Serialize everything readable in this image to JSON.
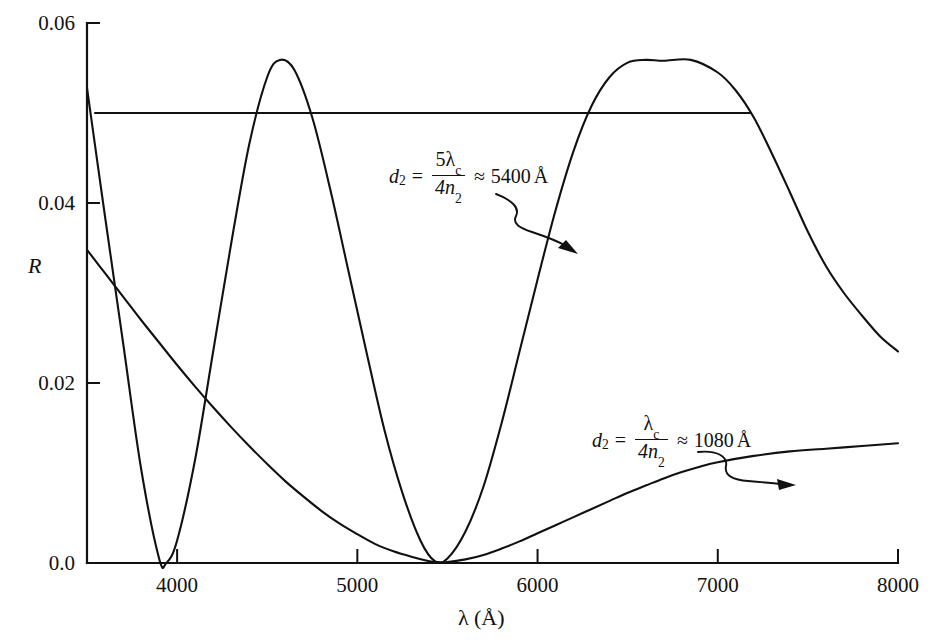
{
  "chart_data": {
    "type": "line",
    "title": "",
    "xlabel": "λ (Å)",
    "ylabel": "R",
    "xlim": [
      3500,
      8000
    ],
    "ylim": [
      0.0,
      0.06
    ],
    "grid": false,
    "legend_position": "none",
    "x_ticks": [
      4000,
      5000,
      6000,
      7000,
      8000
    ],
    "x_tick_labels": [
      "4000",
      "5000",
      "6000",
      "7000",
      "8000"
    ],
    "y_ticks": [
      0.0,
      0.02,
      0.04,
      0.06
    ],
    "y_tick_labels": [
      "0.0",
      "0.02",
      "0.04",
      "0.06"
    ],
    "series": [
      {
        "name": "d2 = 5*lambda_c/(4*n2) ~ 5400 A",
        "x": [
          3500,
          3600,
          3700,
          3800,
          3900,
          3940,
          4000,
          4100,
          4200,
          4300,
          4400,
          4500,
          4570,
          4650,
          4750,
          4850,
          4950,
          5050,
          5150,
          5250,
          5350,
          5430,
          5500,
          5600,
          5700,
          5800,
          5900,
          6000,
          6100,
          6200,
          6300,
          6400,
          6500,
          6600,
          6700,
          6850,
          7000,
          7100,
          7200,
          7300,
          7400,
          7500,
          7600,
          7700,
          7800,
          7900,
          8000
        ],
        "y": [
          0.0528,
          0.0385,
          0.0245,
          0.0105,
          0.0005,
          0.0,
          0.0025,
          0.0115,
          0.0235,
          0.0355,
          0.0465,
          0.054,
          0.0559,
          0.0548,
          0.0495,
          0.0415,
          0.0325,
          0.0235,
          0.0148,
          0.0078,
          0.0025,
          0.0002,
          0.0005,
          0.0035,
          0.0085,
          0.0155,
          0.0235,
          0.0315,
          0.0392,
          0.0458,
          0.0508,
          0.054,
          0.0556,
          0.0559,
          0.0558,
          0.0559,
          0.0545,
          0.0525,
          0.0495,
          0.0455,
          0.0412,
          0.0368,
          0.033,
          0.03,
          0.0275,
          0.0252,
          0.0235
        ]
      },
      {
        "name": "d2 = lambda_c/(4*n2) ~ 1080 A",
        "x": [
          3500,
          3600,
          3700,
          3800,
          3900,
          4000,
          4100,
          4200,
          4300,
          4400,
          4500,
          4600,
          4700,
          4800,
          4900,
          5000,
          5100,
          5200,
          5300,
          5400,
          5450,
          5500,
          5600,
          5700,
          5800,
          5900,
          6000,
          6100,
          6200,
          6300,
          6400,
          6500,
          6600,
          6700,
          6800,
          6900,
          7000,
          7200,
          7400,
          7600,
          7800,
          8000
        ],
        "y": [
          0.0348,
          0.0322,
          0.0296,
          0.027,
          0.0245,
          0.022,
          0.0196,
          0.0173,
          0.0151,
          0.013,
          0.011,
          0.0091,
          0.0074,
          0.0058,
          0.0044,
          0.0032,
          0.0021,
          0.0013,
          0.0007,
          0.0002,
          0.0001,
          0.0001,
          0.0004,
          0.0009,
          0.0016,
          0.0024,
          0.0033,
          0.0042,
          0.0051,
          0.006,
          0.0069,
          0.0078,
          0.0086,
          0.0094,
          0.0101,
          0.0107,
          0.0112,
          0.0119,
          0.0124,
          0.0127,
          0.013,
          0.0133
        ]
      },
      {
        "name": "reference-level",
        "type": "horizontal-line",
        "y_value": 0.05,
        "x_start": 3540,
        "x_end": 7190
      }
    ],
    "annotations": [
      {
        "id": "annotation-5400",
        "lhs": "d",
        "lhs_sub": "2",
        "equals": "=",
        "numerator": "5λ",
        "numerator_sub": "c",
        "denominator": "4n",
        "denominator_sub": "2",
        "approx": "≈",
        "value": "5400",
        "unit": "Å",
        "points_to": {
          "x": 6130,
          "y": 0.0375
        }
      },
      {
        "id": "annotation-1080",
        "lhs": "d",
        "lhs_sub": "2",
        "equals": "=",
        "numerator": "λ",
        "numerator_sub": "c",
        "denominator": "4n",
        "denominator_sub": "2",
        "approx": "≈",
        "value": "1080",
        "unit": "Å",
        "points_to": {
          "x": 7090,
          "y": 0.0092
        }
      }
    ]
  },
  "axes": {
    "y_label": "R",
    "x_label_lambda": "λ",
    "x_label_unit": "(Å)"
  },
  "colors": {
    "ink": "#111111",
    "background": "#ffffff"
  }
}
